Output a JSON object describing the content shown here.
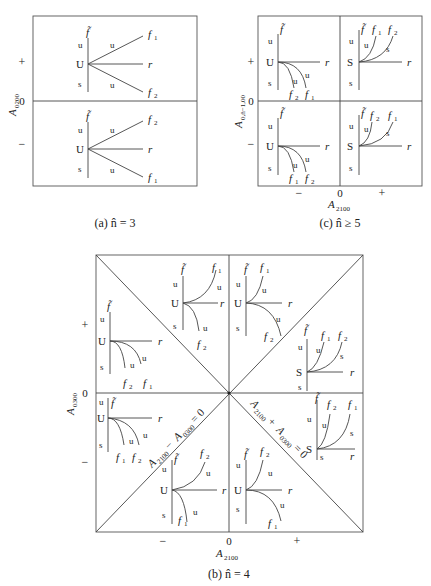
{
  "figures": {
    "a": {
      "caption": "(a) n̂ = 3",
      "y_axis_label": "A",
      "y_axis_sub": "0200",
      "y_ticks": [
        "+",
        "0",
        "−"
      ],
      "panels": [
        {
          "sign": "+",
          "node": "U",
          "axis_top": "f̃",
          "vert_labels": [
            "u",
            "s"
          ],
          "branches": [
            {
              "label": "f",
              "sub": "1",
              "edge": "u"
            },
            {
              "label": "r"
            },
            {
              "label": "f",
              "sub": "2",
              "edge": "u"
            }
          ]
        },
        {
          "sign": "−",
          "node": "U",
          "axis_top": "f̃",
          "vert_labels": [
            "u",
            "s"
          ],
          "branches": [
            {
              "label": "f",
              "sub": "2",
              "edge": "u"
            },
            {
              "label": "r"
            },
            {
              "label": "f",
              "sub": "1",
              "edge": "u"
            }
          ]
        }
      ]
    },
    "c": {
      "caption": "(c) n̂ ≥ 5",
      "y_axis_label": "A",
      "y_axis_sub": "0,n̂−1,00",
      "x_axis_label": "A",
      "x_axis_sub": "2100",
      "y_ticks": [
        "+",
        "0",
        "−"
      ],
      "x_ticks": [
        "−",
        "0",
        "+"
      ],
      "panels": [
        {
          "pos": "top-left",
          "node": "U",
          "curves": [
            "f2",
            "f1"
          ],
          "edge_labels": [
            "u",
            "u"
          ]
        },
        {
          "pos": "top-right",
          "node": "S",
          "curves": [
            "f1",
            "f2"
          ],
          "edge_labels": [
            "u",
            "s"
          ]
        },
        {
          "pos": "bottom-left",
          "node": "U",
          "curves": [
            "f1",
            "f2"
          ],
          "edge_labels": [
            "u",
            "u"
          ]
        },
        {
          "pos": "bottom-right",
          "node": "S",
          "curves": [
            "f2",
            "f1"
          ],
          "edge_labels": [
            "u",
            "s"
          ]
        }
      ]
    },
    "b": {
      "caption": "(b) n̂ = 4",
      "y_axis_label": "A",
      "y_axis_sub": "0300",
      "x_axis_label": "A",
      "x_axis_sub": "2100",
      "y_ticks": [
        "+",
        "0",
        "−"
      ],
      "x_ticks": [
        "−",
        "0",
        "+"
      ],
      "diag_minus": "A2100 − A0300 = 0",
      "diag_plus": "A2100 + A0300 = 0",
      "diag_minus_parts": {
        "a": "A",
        "a_sub": "2100",
        "op": " − ",
        "b": "A",
        "b_sub": "0300",
        "eq": " = 0"
      },
      "diag_plus_parts": {
        "a": "A",
        "a_sub": "2100",
        "op": " + ",
        "b": "A",
        "b_sub": "0300",
        "eq": " = 0"
      }
    }
  },
  "glyphs": {
    "f_tilde": "f̃",
    "f": "f",
    "r": "r",
    "u": "u",
    "s": "s",
    "U": "U",
    "S": "S",
    "sub1": "1",
    "sub2": "2"
  }
}
